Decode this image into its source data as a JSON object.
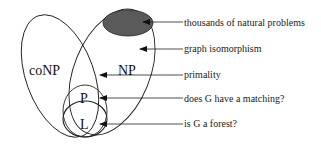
{
  "diagram": {
    "classes": {
      "conp": "coNP",
      "np": "NP",
      "p": "P",
      "l": "L"
    },
    "annotations": [
      {
        "text": "thousands of natural problems",
        "y": 22
      },
      {
        "text": "graph isomorphism",
        "y": 49
      },
      {
        "text": "primality",
        "y": 75
      },
      {
        "text": "does G have a matching?",
        "y": 98
      },
      {
        "text": "is G a forest?",
        "y": 124
      }
    ],
    "colors": {
      "stroke": "#222222",
      "shaded_region": "#5a5a5a",
      "background": "#ffffff"
    }
  }
}
